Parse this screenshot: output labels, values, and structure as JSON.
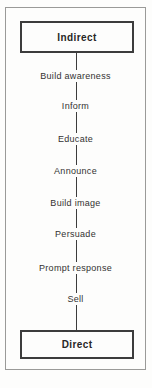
{
  "diagram": {
    "top_box_label": "Indirect",
    "bottom_box_label": "Direct",
    "steps": [
      {
        "label": "Build awareness"
      },
      {
        "label": "Inform"
      },
      {
        "label": "Educate"
      },
      {
        "label": "Announce"
      },
      {
        "label": "Build image"
      },
      {
        "label": "Persuade"
      },
      {
        "label": "Prompt response"
      },
      {
        "label": "Sell"
      }
    ],
    "colors": {
      "box_border": "#3c3c3c",
      "frame_border": "#9a9a98",
      "connector": "#3c3c3c",
      "text": "#333231",
      "background": "#fdfdfc"
    }
  }
}
